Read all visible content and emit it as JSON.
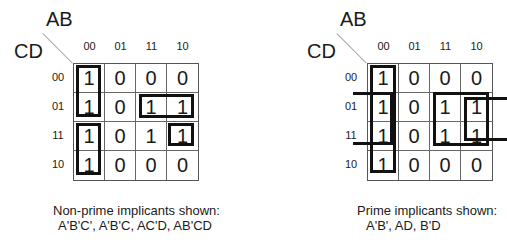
{
  "left_map": {
    "row_var_label": "CD",
    "col_var_label": "AB",
    "col_headers": [
      "00",
      "01",
      "11",
      "10"
    ],
    "row_headers": [
      "00",
      "01",
      "11",
      "10"
    ],
    "cells": [
      [
        "1",
        "0",
        "0",
        "0"
      ],
      [
        "1",
        "0",
        "1",
        "1"
      ],
      [
        "1",
        "0",
        "1",
        "1"
      ],
      [
        "1",
        "0",
        "0",
        "0"
      ]
    ],
    "caption_title": "Non-prime implicants shown:",
    "caption_terms": "A'B'C', A'B'C, AC'D, AB'CD"
  },
  "right_map": {
    "row_var_label": "CD",
    "col_var_label": "AB",
    "col_headers": [
      "00",
      "01",
      "11",
      "10"
    ],
    "row_headers": [
      "00",
      "01",
      "11",
      "10"
    ],
    "cells": [
      [
        "1",
        "0",
        "0",
        "0"
      ],
      [
        "1",
        "0",
        "1",
        "1"
      ],
      [
        "1",
        "0",
        "1",
        "1"
      ],
      [
        "1",
        "0",
        "0",
        "0"
      ]
    ],
    "caption_title": "Prime implicants shown:",
    "caption_terms": "A'B', AD, B'D"
  }
}
